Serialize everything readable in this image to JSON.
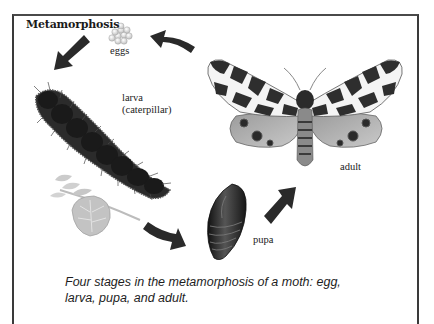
{
  "diagram": {
    "title": "Metamorphosis",
    "stages": [
      {
        "id": "egg",
        "label": "eggs"
      },
      {
        "id": "larva",
        "label_line1": "larva",
        "label_line2": "(caterpillar)"
      },
      {
        "id": "pupa",
        "label": "pupa"
      },
      {
        "id": "adult",
        "label": "adult"
      }
    ],
    "cycle_order": [
      "eggs",
      "larva",
      "pupa",
      "adult"
    ],
    "caption_line1": "Four stages in the metamorphosis of a moth: egg,",
    "caption_line2": "larva, pupa, and adult.",
    "colors": {
      "frame": "#3a3a3a",
      "arrow": "#2a2a2a",
      "text": "#1a1a1a",
      "background": "#ffffff"
    }
  }
}
